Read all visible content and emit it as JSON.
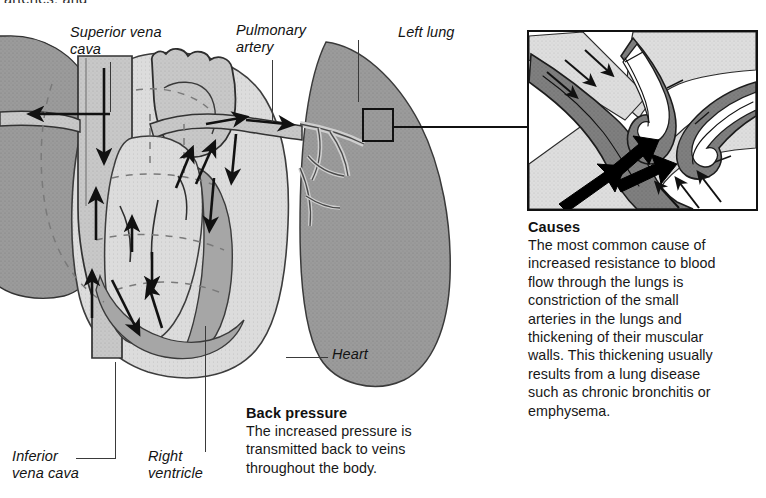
{
  "page": {
    "width": 766,
    "height": 498,
    "background": "#ffffff",
    "clipped_top_text": "arteries, and"
  },
  "figure": {
    "title_hidden": true,
    "kind": "medical-anatomical-illustration"
  },
  "labels": [
    {
      "id": "superior-vena-cava",
      "text": "Superior vena\ncava",
      "x": 70,
      "y": 24
    },
    {
      "id": "pulmonary-artery",
      "text": "Pulmonary\nartery",
      "x": 236,
      "y": 22
    },
    {
      "id": "left-lung",
      "text": "Left lung",
      "x": 398,
      "y": 24
    },
    {
      "id": "heart",
      "text": "Heart",
      "x": 332,
      "y": 346
    },
    {
      "id": "inferior-vena-cava",
      "text": "Inferior\nvena cava",
      "x": 12,
      "y": 448
    },
    {
      "id": "right-ventricle",
      "text": "Right\nventricle",
      "x": 148,
      "y": 448
    }
  ],
  "text_blocks": [
    {
      "id": "back-pressure",
      "title": "Back pressure",
      "body": "The increased pressure is\ntransmitted back to veins\nthroughout the body.",
      "x": 246,
      "y": 404,
      "width": 230
    },
    {
      "id": "causes",
      "title": "Causes",
      "body": "The most common cause of\nincreased resistance to blood\nflow through the lungs is\nconstriction of the small\narteries in the lungs and\nthickening of their muscular\nwalls. This thickening usually\nresults from a lung disease\nsuch as chronic bronchitis or\nemphysema.",
      "x": 528,
      "y": 218,
      "width": 238
    }
  ],
  "inset": {
    "id": "constricted-artery-detail",
    "x": 527,
    "y": 30,
    "width": 231,
    "height": 181,
    "connector": {
      "x": 392,
      "y": 126,
      "length": 135
    },
    "marker": {
      "x": 362,
      "y": 108,
      "width": 32,
      "height": 34
    },
    "arrow_groups": [
      {
        "name": "constriction-arrows-upper-left",
        "count": 3,
        "direction": "down-right",
        "style": "outline"
      },
      {
        "name": "constriction-arrows-lower-right",
        "count": 3,
        "direction": "up-left",
        "style": "outline"
      },
      {
        "name": "blood-flow-arrows",
        "count": 3,
        "direction": "up-right",
        "style": "solid-black"
      }
    ]
  },
  "colors": {
    "ink": "#111111",
    "lung_fill": "#9b9b9b",
    "heart_fill": "#cfcfcf",
    "chamber_fill": "#e4e4e4",
    "muscle_fill": "#a3a3a3",
    "vessel_fill": "#c4c4c4",
    "inset_wall_dark": "#6f6f6f",
    "inset_lumen": "#ffffff",
    "inset_outer": "#d8d8d8",
    "leader": "#3a3a3a",
    "page": "#ffffff"
  },
  "arrow_legend": {
    "solid_black": "blood flow direction",
    "dashed": "chamber outlines / pressure transmission"
  }
}
